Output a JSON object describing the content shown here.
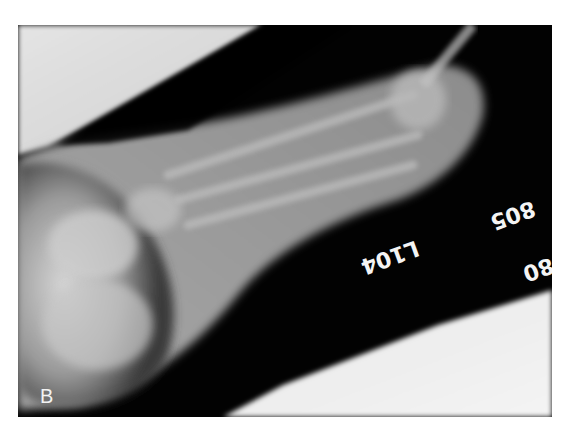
{
  "figure": {
    "panel_label": "B",
    "markers": {
      "side_marker": "L104",
      "number_1": "805",
      "number_2": "80"
    },
    "colors": {
      "background": "#ffffff",
      "film_dark": "#000000",
      "bone_light": "#d8d8d8",
      "film_unexposed": "#eeeeee"
    }
  }
}
